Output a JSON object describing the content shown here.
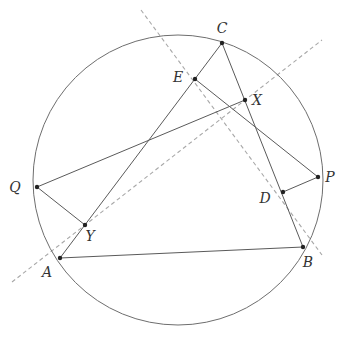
{
  "figure": {
    "type": "geometry-diagram",
    "circle": {
      "cx": 178,
      "cy": 180,
      "r": 145
    },
    "points": [
      {
        "name": "C",
        "x": 222,
        "y": 43,
        "label_dx": 0,
        "label_dy": -10
      },
      {
        "name": "E",
        "x": 195,
        "y": 79,
        "label_dx": -17,
        "label_dy": 3
      },
      {
        "name": "X",
        "x": 245,
        "y": 100,
        "label_dx": 12,
        "label_dy": 5
      },
      {
        "name": "P",
        "x": 318,
        "y": 177,
        "label_dx": 12,
        "label_dy": 5
      },
      {
        "name": "D",
        "x": 283,
        "y": 192,
        "label_dx": -18,
        "label_dy": 11
      },
      {
        "name": "B",
        "x": 303,
        "y": 247,
        "label_dx": 5,
        "label_dy": 20
      },
      {
        "name": "A",
        "x": 60,
        "y": 258,
        "label_dx": -13,
        "label_dy": 19
      },
      {
        "name": "Q",
        "x": 37,
        "y": 187,
        "label_dx": -22,
        "label_dy": 5
      },
      {
        "name": "Y",
        "x": 85,
        "y": 225,
        "label_dx": 5,
        "label_dy": 16
      }
    ],
    "segments": [
      {
        "from": "A",
        "to": "B"
      },
      {
        "from": "B",
        "to": "C"
      },
      {
        "from": "C",
        "to": "A"
      },
      {
        "from": "Q",
        "to": "X"
      },
      {
        "from": "Q",
        "to": "Y"
      },
      {
        "from": "E",
        "to": "P"
      },
      {
        "from": "P",
        "to": "D"
      }
    ],
    "dashed_lines": [
      {
        "x1": 141,
        "y1": 10,
        "x2": 322,
        "y2": 255
      },
      {
        "x1": 12,
        "y1": 282,
        "x2": 322,
        "y2": 40
      }
    ],
    "labels": [
      "A",
      "B",
      "C",
      "D",
      "E",
      "P",
      "Q",
      "X",
      "Y"
    ]
  }
}
